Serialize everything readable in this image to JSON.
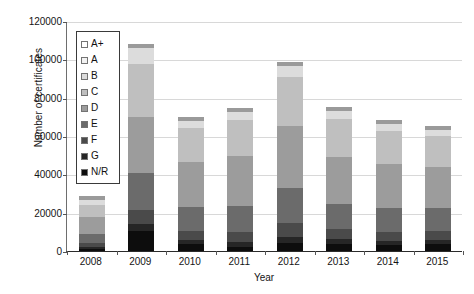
{
  "chart_data": {
    "type": "bar",
    "subtype": "stacked-bar",
    "title": "",
    "xlabel": "Year",
    "ylabel": "Number of certificates",
    "ylim": [
      0,
      120000
    ],
    "ytick_step": 20000,
    "yticks": [
      "120000",
      "100000",
      "80000",
      "60000",
      "40000",
      "20000",
      "0"
    ],
    "grid": true,
    "legend_position": "upper-left-inside",
    "categories": [
      "2008",
      "2009",
      "2010",
      "2011",
      "2012",
      "2013",
      "2014",
      "2015"
    ],
    "series": [
      {
        "name": "A+",
        "color": "#ffffff",
        "values": [
          100,
          200,
          150,
          150,
          200,
          250,
          250,
          300
        ]
      },
      {
        "name": "A",
        "color": "#f2f2f2",
        "values": [
          400,
          900,
          700,
          750,
          900,
          1100,
          1100,
          1200
        ]
      },
      {
        "name": "B",
        "color": "#dcdcdc",
        "values": [
          2600,
          8500,
          3700,
          4200,
          5500,
          4400,
          3500,
          3200
        ]
      },
      {
        "name": "C",
        "color": "#bfbfbf",
        "values": [
          6200,
          27500,
          17500,
          19000,
          25500,
          19500,
          17000,
          16000
        ]
      },
      {
        "name": "D",
        "color": "#9c9c9c",
        "values": [
          8800,
          29000,
          23500,
          26000,
          32500,
          24500,
          23000,
          21500
        ]
      },
      {
        "name": "E",
        "color": "#6b6b6b",
        "values": [
          4800,
          19500,
          12500,
          13500,
          18500,
          13500,
          12500,
          12000
        ]
      },
      {
        "name": "F",
        "color": "#4a4a4a",
        "values": [
          1900,
          7500,
          4800,
          5200,
          7000,
          5200,
          4800,
          4500
        ]
      },
      {
        "name": "G",
        "color": "#262626",
        "values": [
          900,
          3500,
          2200,
          2400,
          3200,
          2400,
          2200,
          2100
        ]
      },
      {
        "name": "N/R",
        "color": "#0d0d0d",
        "values": [
          1300,
          10400,
          3450,
          2300,
          4200,
          3650,
          3150,
          3700
        ]
      }
    ],
    "totals": [
      26000,
      107000,
      68500,
      73500,
      97500,
      74500,
      67500,
      64500
    ],
    "legend_entries": [
      "A+",
      "A",
      "B",
      "C",
      "D",
      "E",
      "F",
      "G",
      "N/R"
    ]
  }
}
